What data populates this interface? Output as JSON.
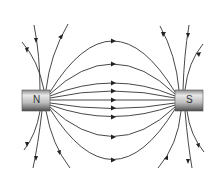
{
  "diagram": {
    "magnets": [
      {
        "id": "north",
        "label": "N",
        "x": 22,
        "y": 90,
        "width": 28,
        "height": 21
      },
      {
        "id": "south",
        "label": "S",
        "x": 175,
        "y": 90,
        "width": 28,
        "height": 21
      }
    ],
    "colors": {
      "line": "#333333",
      "magnet_light": "#e6e6e6",
      "magnet_dark": "#6a6a6a",
      "background": "#ffffff"
    },
    "field_line_peaks_y": [
      41,
      64,
      83,
      91,
      100,
      108,
      117,
      137,
      160
    ],
    "arrow_direction": "N to S"
  }
}
